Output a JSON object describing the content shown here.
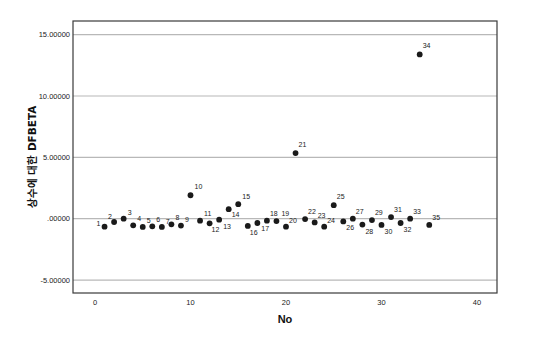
{
  "chart_data": {
    "type": "scatter",
    "title": "",
    "xlabel": "No",
    "ylabel": "상수에 대한 DFBETA",
    "xlim": [
      0,
      40
    ],
    "ylim": [
      -6,
      16
    ],
    "x_ticks": [
      0,
      10,
      20,
      30,
      40
    ],
    "x_tick_labels": [
      "0",
      "10",
      "20",
      "30",
      "40"
    ],
    "y_ticks": [
      15,
      10,
      5,
      0,
      -5
    ],
    "y_tick_labels": [
      "15.00000",
      "10.00000",
      "5.00000",
      ".00000",
      "-5.00000"
    ],
    "grid": "horizontal",
    "legend": "none",
    "point_labels": true,
    "points": [
      {
        "label": "1",
        "x": 1,
        "y": -0.65
      },
      {
        "label": "2",
        "x": 2,
        "y": -0.27
      },
      {
        "label": "3",
        "x": 3,
        "y": 0.0
      },
      {
        "label": "4",
        "x": 4,
        "y": -0.54
      },
      {
        "label": "5",
        "x": 5,
        "y": -0.67
      },
      {
        "label": "6",
        "x": 6,
        "y": -0.62
      },
      {
        "label": "7",
        "x": 7,
        "y": -0.67
      },
      {
        "label": "8",
        "x": 8,
        "y": -0.46
      },
      {
        "label": "9",
        "x": 9,
        "y": -0.56
      },
      {
        "label": "10",
        "x": 10,
        "y": 1.91
      },
      {
        "label": "11",
        "x": 11,
        "y": -0.16
      },
      {
        "label": "12",
        "x": 12,
        "y": -0.38
      },
      {
        "label": "13",
        "x": 13,
        "y": -0.08
      },
      {
        "label": "14",
        "x": 14,
        "y": 0.78
      },
      {
        "label": "15",
        "x": 15,
        "y": 1.18
      },
      {
        "label": "16",
        "x": 16,
        "y": -0.59
      },
      {
        "label": "17",
        "x": 17,
        "y": -0.35
      },
      {
        "label": "18",
        "x": 18,
        "y": -0.16
      },
      {
        "label": "19",
        "x": 19,
        "y": -0.19
      },
      {
        "label": "20",
        "x": 20,
        "y": -0.65
      },
      {
        "label": "21",
        "x": 21,
        "y": 5.35
      },
      {
        "label": "22",
        "x": 22,
        "y": -0.03
      },
      {
        "label": "23",
        "x": 23,
        "y": -0.3
      },
      {
        "label": "24",
        "x": 24,
        "y": -0.65
      },
      {
        "label": "25",
        "x": 25,
        "y": 1.1
      },
      {
        "label": "26",
        "x": 26,
        "y": -0.22
      },
      {
        "label": "27",
        "x": 27,
        "y": 0.0
      },
      {
        "label": "28",
        "x": 28,
        "y": -0.48
      },
      {
        "label": "29",
        "x": 29,
        "y": -0.11
      },
      {
        "label": "30",
        "x": 30,
        "y": -0.51
      },
      {
        "label": "31",
        "x": 31,
        "y": 0.13
      },
      {
        "label": "32",
        "x": 32,
        "y": -0.35
      },
      {
        "label": "33",
        "x": 33,
        "y": 0.0
      },
      {
        "label": "34",
        "x": 34,
        "y": 13.39
      },
      {
        "label": "35",
        "x": 35,
        "y": -0.51
      }
    ],
    "label_offsets": {
      "1": [
        -8,
        -1
      ],
      "2": [
        -6,
        -3
      ],
      "3": [
        4,
        -4
      ],
      "4": [
        4,
        -4
      ],
      "5": [
        4,
        -4
      ],
      "6": [
        4,
        -4
      ],
      "7": [
        4,
        -3
      ],
      "8": [
        4,
        -4
      ],
      "9": [
        4,
        -4
      ],
      "10": [
        4,
        -6
      ],
      "11": [
        4,
        -5
      ],
      "12": [
        2,
        9
      ],
      "13": [
        4,
        9
      ],
      "14": [
        3,
        8
      ],
      "15": [
        4,
        -5
      ],
      "16": [
        2,
        9
      ],
      "17": [
        4,
        8
      ],
      "18": [
        3,
        -5
      ],
      "19": [
        5,
        -5
      ],
      "20": [
        3,
        -4
      ],
      "21": [
        3,
        -6
      ],
      "22": [
        3,
        -5
      ],
      "23": [
        3,
        -4
      ],
      "24": [
        3,
        -4
      ],
      "25": [
        3,
        -6
      ],
      "26": [
        3,
        9
      ],
      "27": [
        3,
        -5
      ],
      "28": [
        3,
        9
      ],
      "29": [
        3,
        -5
      ],
      "30": [
        3,
        9
      ],
      "31": [
        3,
        -5
      ],
      "32": [
        3,
        9
      ],
      "33": [
        3,
        -5
      ],
      "34": [
        3,
        -6
      ],
      "35": [
        3,
        -5
      ]
    },
    "colors": {
      "point": "#1a1a1a",
      "grid": "#b8b8b8",
      "frame": "#3a3a3a",
      "background": "#ffffff"
    }
  }
}
